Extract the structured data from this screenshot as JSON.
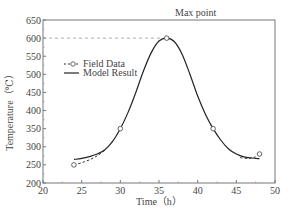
{
  "chart_data": {
    "type": "line",
    "title": "",
    "xlabel": "Time（h）",
    "ylabel": "Temperature（℃）",
    "xlim": [
      20,
      50
    ],
    "ylim": [
      200,
      650
    ],
    "xticks": [
      20,
      25,
      30,
      35,
      40,
      45,
      50
    ],
    "yticks": [
      200,
      250,
      300,
      350,
      400,
      450,
      500,
      550,
      600,
      650
    ],
    "grid": false,
    "legend_position": "upper left",
    "series": [
      {
        "name": "Field Data",
        "style": "dashed-with-circle-markers",
        "x": [
          24,
          30,
          36,
          42,
          48
        ],
        "y": [
          250,
          350,
          600,
          350,
          280
        ],
        "dashed_segments": [
          [
            24,
            250
          ],
          [
            25,
            256
          ],
          [
            26,
            264
          ],
          [
            27,
            275
          ],
          [
            28,
            290
          ]
        ],
        "dashed_tail": [
          [
            45.5,
            270
          ],
          [
            46.5,
            268
          ],
          [
            47.5,
            272
          ]
        ]
      },
      {
        "name": "Model Result",
        "style": "solid",
        "x": [
          24,
          25,
          26,
          27,
          28,
          29,
          30,
          31,
          32,
          33,
          34,
          35,
          36,
          37,
          38,
          39,
          40,
          41,
          42,
          43,
          44,
          45,
          46,
          47,
          48
        ],
        "y": [
          265,
          268,
          273,
          280,
          292,
          315,
          350,
          395,
          450,
          510,
          560,
          592,
          600,
          590,
          555,
          500,
          440,
          390,
          350,
          318,
          294,
          280,
          272,
          269,
          267
        ]
      }
    ],
    "annotations": [
      {
        "text": "Max point",
        "x": 36,
        "y": 600,
        "reference_line": {
          "y": 600,
          "from_x": 20,
          "to_x": 36,
          "style": "dashed"
        }
      }
    ]
  },
  "labels": {
    "max_point": "Max point",
    "legend_field": "Field Data",
    "legend_model": "Model Result",
    "xlabel": "Time（h）",
    "ylabel": "Temperature（℃）"
  }
}
